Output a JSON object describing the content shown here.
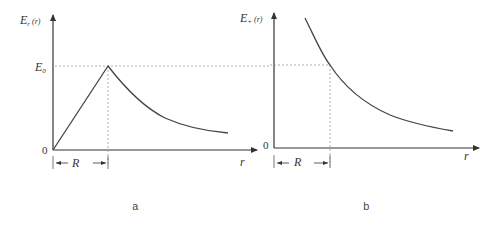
{
  "figure": {
    "panels": [
      {
        "id": "a",
        "caption": "a",
        "y_label": "E",
        "y_label_sub": "r",
        "y_label_arg": "(r)",
        "x_label": "r",
        "origin_label": "0",
        "level_label": "E",
        "level_label_sub": "0",
        "dimension_label": "R",
        "curve": "linear rise from 0 to E0 at r=R, then decay ~ 1/r^2"
      },
      {
        "id": "b",
        "caption": "b",
        "y_label": "E",
        "y_label_sub": "+",
        "y_label_arg": "(r)",
        "x_label": "r",
        "origin_label": "0",
        "dimension_label": "R",
        "curve": "monotonic decay ~ 1/r^2, passes E0 at r=R"
      }
    ]
  },
  "colors": {
    "axis": "#333333",
    "curve": "#444444",
    "guide": "#999999"
  }
}
